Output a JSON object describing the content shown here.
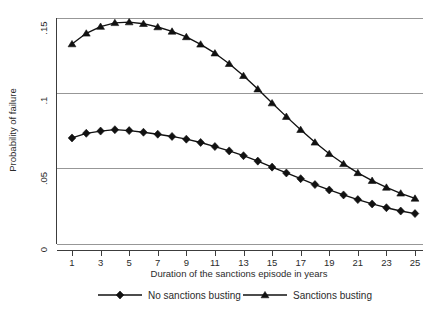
{
  "chart_data": {
    "type": "line",
    "title": "",
    "xlabel": "Duration of the sanctions episode in years",
    "ylabel": "Probability of failure",
    "x": [
      1,
      2,
      3,
      4,
      5,
      6,
      7,
      8,
      9,
      10,
      11,
      12,
      13,
      14,
      15,
      16,
      17,
      18,
      19,
      20,
      21,
      22,
      23,
      24,
      25
    ],
    "xlim": [
      0.5,
      25.5
    ],
    "ylim": [
      0,
      0.15
    ],
    "xticks": [
      1,
      3,
      5,
      7,
      9,
      11,
      13,
      15,
      17,
      19,
      21,
      23,
      25
    ],
    "xtick_labels": [
      "1",
      "3",
      "5",
      "7",
      "9",
      "11",
      "13",
      "15",
      "17",
      "19",
      "21",
      "23",
      "25"
    ],
    "yticks": [
      0,
      0.05,
      0.1,
      0.15
    ],
    "ytick_labels": [
      "0",
      ".05",
      ".1",
      ".15"
    ],
    "grid": "horizontal",
    "legend_position": "below",
    "series": [
      {
        "name": "No sanctions busting",
        "marker": "diamond",
        "color": "#111111",
        "values": [
          0.0702,
          0.0733,
          0.0748,
          0.0757,
          0.0751,
          0.074,
          0.0727,
          0.0712,
          0.0694,
          0.0672,
          0.0645,
          0.0616,
          0.0584,
          0.0548,
          0.0508,
          0.0469,
          0.0431,
          0.0392,
          0.0356,
          0.0323,
          0.0292,
          0.0263,
          0.0238,
          0.0216,
          0.0199
        ]
      },
      {
        "name": "Sanctions busting",
        "marker": "triangle",
        "color": "#111111",
        "values": [
          0.1327,
          0.1398,
          0.1443,
          0.1468,
          0.1473,
          0.1462,
          0.144,
          0.1411,
          0.1374,
          0.1325,
          0.1266,
          0.1196,
          0.1116,
          0.1027,
          0.0934,
          0.0844,
          0.0757,
          0.0673,
          0.0597,
          0.053,
          0.047,
          0.0418,
          0.0373,
          0.0334,
          0.03
        ]
      }
    ]
  },
  "legend": {
    "items": [
      {
        "label": "No sanctions busting",
        "marker": "diamond"
      },
      {
        "label": "Sanctions busting",
        "marker": "triangle"
      }
    ]
  }
}
